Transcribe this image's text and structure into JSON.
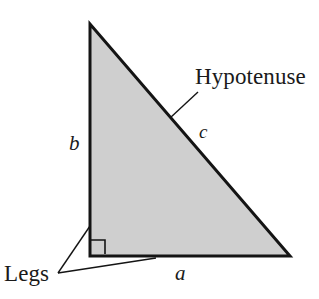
{
  "figure": {
    "background_color": "#ffffff",
    "triangle": {
      "fill_color": "#cfcfcf",
      "stroke_color": "#141414",
      "stroke_width": 3,
      "vertices": {
        "apex": [
          90,
          24
        ],
        "right_angle": [
          90,
          256
        ],
        "bottom_right": [
          290,
          256
        ]
      }
    },
    "right_angle_marker": {
      "name": "right-angle-square",
      "x": 91,
      "y": 240,
      "size": 14,
      "stroke_color": "#141414"
    },
    "labels": {
      "hypotenuse": "Hypotenuse",
      "legs": "Legs",
      "side_a": "a",
      "side_b": "b",
      "side_c": "c"
    },
    "leader_lines": {
      "hypotenuse": {
        "from": [
          198,
          92
        ],
        "to": [
          170,
          118
        ]
      },
      "leg_vertical": {
        "from": [
          58,
          273
        ],
        "to": [
          90,
          226
        ]
      },
      "leg_horizontal": {
        "from": [
          58,
          273
        ],
        "to": [
          156,
          258
        ]
      }
    }
  }
}
